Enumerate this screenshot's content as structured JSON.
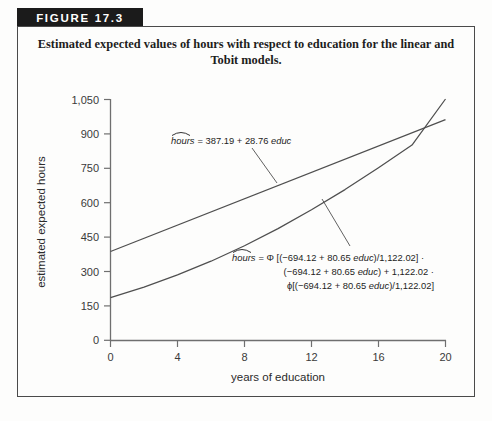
{
  "figure": {
    "banner_label": "FIGURE 17.3",
    "caption": "Estimated expected values of hours with respect to education for the linear and Tobit models."
  },
  "chart_data": {
    "type": "line",
    "title": "Estimated expected values of hours with respect to education for the linear and Tobit models.",
    "xlabel": "years of education",
    "ylabel": "estimated expected hours",
    "xlim": [
      0,
      20
    ],
    "ylim": [
      0,
      1050
    ],
    "xticks": [
      "0",
      "4",
      "8",
      "12",
      "16",
      "20"
    ],
    "xtick_values": [
      0,
      4,
      8,
      12,
      16,
      20
    ],
    "yticks": [
      "0",
      "150",
      "300",
      "450",
      "600",
      "750",
      "900",
      "1,050"
    ],
    "ytick_values": [
      0,
      150,
      300,
      450,
      600,
      750,
      900,
      1050
    ],
    "grid": false,
    "legend": "none",
    "series": [
      {
        "name": "linear model",
        "equation_display": "hours = 387.19 + 28.76 educ",
        "intercept": 387.19,
        "slope": 28.76,
        "x": [
          0,
          2,
          4,
          6,
          8,
          10,
          12,
          14,
          16,
          18,
          20
        ],
        "values": [
          387.19,
          444.71,
          502.23,
          559.75,
          617.27,
          674.79,
          732.31,
          789.83,
          847.35,
          904.87,
          962.39
        ]
      },
      {
        "name": "Tobit model",
        "equation_display": "hours = Φ[(−694.12 + 80.65 educ)/1,122.02] · (−694.12 + 80.65 educ) + 1,122.02 · ϕ[(−694.12 + 80.65 educ)/1,122.02]",
        "beta0": -694.12,
        "beta1": 80.65,
        "sigma": 1122.02,
        "x": [
          0,
          2,
          4,
          6,
          8,
          10,
          12,
          14,
          16,
          18,
          20
        ],
        "values": [
          186,
          232,
          285,
          345,
          412,
          487,
          569,
          657,
          752,
          851,
          1052
        ]
      }
    ],
    "annotations": [
      {
        "name": "linear-equation",
        "lines": [
          {
            "lhs": "hours",
            "rest": " = 387.19 + 28.76 ",
            "italic_tail": "educ"
          }
        ]
      },
      {
        "name": "tobit-equation",
        "lines": [
          {
            "text": "hours = Φ[(−694.12 + 80.65 educ)/1,122.02] ·"
          },
          {
            "text": "(−694.12 + 80.65 educ) + 1,122.02 ·"
          },
          {
            "text": "ϕ[(−694.12 + 80.65 educ)/1,122.02]"
          }
        ]
      }
    ]
  },
  "equations": {
    "linear": {
      "hat_label": "hours",
      "body": "= 387.19 + 28.76 ",
      "var": "educ"
    },
    "tobit": {
      "hat_label": "hours",
      "line1_a": "= Φ [(−694.12 + 80.65 ",
      "line1_b": "educ",
      "line1_c": ")/1,122.02] ·",
      "line2_a": "(−694.12 + 80.65 ",
      "line2_b": "educ",
      "line2_c": ") + 1,122.02 ·",
      "line3_a": "ϕ[(−694.12 + 80.65 ",
      "line3_b": "educ",
      "line3_c": ")/1,122.02]"
    }
  },
  "axes": {
    "x_title": "years of education",
    "y_title": "estimated expected hours",
    "x_labels": [
      "0",
      "4",
      "8",
      "12",
      "16",
      "20"
    ],
    "y_labels": [
      "1,050",
      "900",
      "750",
      "600",
      "450",
      "300",
      "150",
      "0"
    ]
  },
  "colors": {
    "banner_bg": "#1b1b1b",
    "banner_text": "#ffffff",
    "frame": "#4a4a4a",
    "axis": "#6f6f6f",
    "curve": "#4f4f4f",
    "text": "#1d1d1d",
    "page_bg": "#fdfdfc"
  }
}
